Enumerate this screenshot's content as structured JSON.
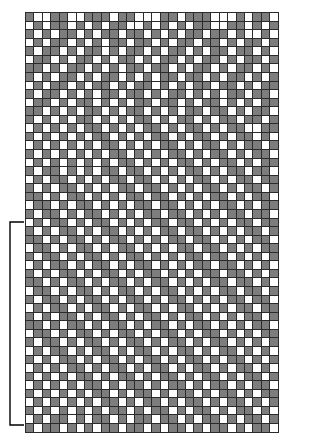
{
  "figure": {
    "kind": "stitch-pattern-chart",
    "colors": {
      "filled": "#7d7d7d",
      "empty": "#ffffff",
      "gridline": "#2b2b2b",
      "bracket": "#000000",
      "background": "#ffffff"
    }
  },
  "grid": {
    "columns": 30,
    "rows": 49,
    "cell_width_px": 8.47,
    "cell_height_px": 8.57,
    "origin_x_px": 25,
    "origin_y_px": 12,
    "legend": {
      "1": "filled-square",
      "0": "empty-square"
    },
    "rows_data": [
      "100110011101100011011100010110",
      "010110101011001010101100110101",
      "101011010110110101011011010010",
      "010110101011011010110110101101",
      "101101011010110101101011011010",
      "011010110101101011010110101101",
      "110101101010110110101101011010",
      "101011010110101011011010110101",
      "010110101101011010101101101011",
      "101101010110110101101010110110",
      "011010110101011011010110101011",
      "110101011010110101011011010110",
      "101010110101011010110101101101",
      "010101011010101101011010110011",
      "101010101101010110101101011010",
      "010101010110101011010110101101",
      "101010101011010101101011010110",
      "010101010101101010110101101011",
      "101101010110110101011010110110",
      "010110101011011010101101011011",
      "101011010101101101010110101101",
      "110101101010110110101011010110",
      "011010110101011011010101101011",
      "101101011010101101101010110110",
      "010110101101010110110101011011",
      "101011010110101011011010101101",
      "110101101011010101101101010110",
      "011010110101101010110110101011",
      "101101011010110101011011010101",
      "010110101101011010101101101010",
      "101011010110101101010110110101",
      "110101101011010110101011011010",
      "011010110101101011010101101101",
      "101101011010110101101010110110",
      "010110101101011010110101011011",
      "101011010110101101011010101101",
      "110101101011010110101101010110",
      "011010110101101011010110101011",
      "101101011010110101101011010101",
      "010110101101011010110101101010",
      "101011010110101101011010110101",
      "010101101011010110101101011010",
      "101010110101101011010110101101",
      "010101011010110101101011010110",
      "101010101101011010110101101011",
      "010101010110101101011010110101",
      "101010101011010110101101011010",
      "010110101101011011010110101101",
      "101101010110110101101011010110"
    ]
  },
  "repeat_bracket": {
    "label": "",
    "top_y_px": 222,
    "bottom_y_px": 425,
    "left_x_px": 10,
    "tick_length_px": 14,
    "stroke_width_px": 1.4
  }
}
